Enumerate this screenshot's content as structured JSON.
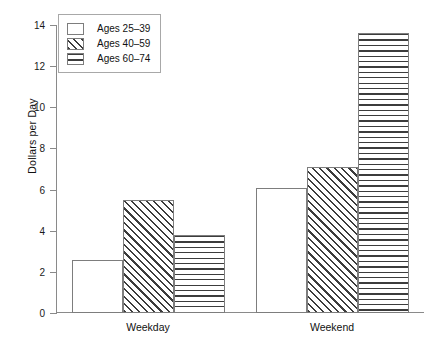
{
  "chart_data": {
    "type": "bar",
    "title": "",
    "xlabel": "",
    "ylabel": "Dollars per Day",
    "categories": [
      "Weekday",
      "Weekend"
    ],
    "series": [
      {
        "name": "Ages 25–39",
        "values": [
          2.6,
          6.1
        ],
        "fill": "solid"
      },
      {
        "name": "Ages 40–59",
        "values": [
          5.5,
          7.1
        ],
        "fill": "diagonal-hatch"
      },
      {
        "name": "Ages 60–74",
        "values": [
          3.8,
          13.6
        ],
        "fill": "horizontal-lines"
      }
    ],
    "ylim": [
      0,
      14
    ],
    "yticks": [
      0,
      2,
      4,
      6,
      8,
      10,
      12,
      14
    ],
    "ytick_labels": [
      "0",
      "2",
      "4",
      "6",
      "8",
      "10",
      "12",
      "14"
    ],
    "grid": false,
    "legend_position": "top-left",
    "colors": {
      "bar_edge": "#7d7d7d",
      "pattern": "#3c3c3c",
      "background": "#ffffff",
      "axis": "#8a8a8a",
      "text": "#111111"
    }
  }
}
